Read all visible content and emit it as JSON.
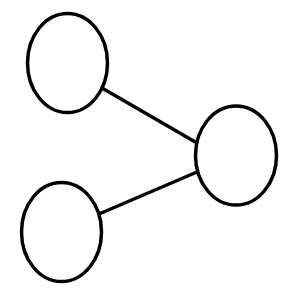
{
  "diagram": {
    "type": "node-link graph",
    "background": "#ffffff",
    "stroke_color": "#000000",
    "stroke_width": 3.5,
    "nodes": [
      {
        "id": "node-top-left",
        "cx": 67.5,
        "cy": 63,
        "rx": 40,
        "ry": 49.5,
        "label": ""
      },
      {
        "id": "node-right",
        "cx": 236,
        "cy": 155.5,
        "rx": 40.5,
        "ry": 49.5,
        "label": ""
      },
      {
        "id": "node-bottom-left",
        "cx": 61.5,
        "cy": 232,
        "rx": 40,
        "ry": 49.5,
        "label": ""
      }
    ],
    "edges": [
      {
        "id": "edge-top-left-right",
        "from": "node-top-left",
        "to": "node-right",
        "x1": 102,
        "y1": 88,
        "x2": 197,
        "y2": 143
      },
      {
        "id": "edge-bottom-left-right",
        "from": "node-bottom-left",
        "to": "node-right",
        "x1": 99,
        "y1": 214,
        "x2": 197,
        "y2": 172
      }
    ]
  }
}
